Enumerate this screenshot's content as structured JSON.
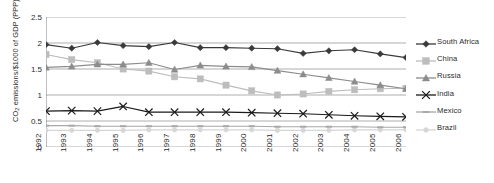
{
  "chart_data": {
    "type": "line",
    "title": "",
    "xlabel": "",
    "ylabel": "CO2 emissions/$1000 of GDP (PPP)",
    "ylabel_prefix": "CO",
    "ylabel_sub": "2",
    "ylabel_suffix": " emissions/$1000 of GDP (PPP)",
    "categories": [
      "1992",
      "1993",
      "1994",
      "1995",
      "1996",
      "1997",
      "1998",
      "1999",
      "2000",
      "2001",
      "2002",
      "2003",
      "2004",
      "2005",
      "2006"
    ],
    "yticks": [
      "0",
      "0.5",
      "1",
      "1.5",
      "2",
      "2.5"
    ],
    "ytick_values": [
      0,
      0.5,
      1,
      1.5,
      2,
      2.5
    ],
    "ylim": [
      0,
      2.5
    ],
    "grid": true,
    "legend_position": "right",
    "series": [
      {
        "name": "South Africa",
        "color": "#3a3a3a",
        "marker": "diamond",
        "values": [
          1.97,
          1.9,
          2.01,
          1.95,
          1.93,
          2.01,
          1.91,
          1.91,
          1.9,
          1.89,
          1.8,
          1.85,
          1.87,
          1.79,
          1.72
        ]
      },
      {
        "name": "China",
        "color": "#bdbdbd",
        "marker": "square",
        "values": [
          1.78,
          1.68,
          1.62,
          1.5,
          1.46,
          1.35,
          1.31,
          1.19,
          1.08,
          1.0,
          1.02,
          1.07,
          1.1,
          1.12,
          1.13
        ]
      },
      {
        "name": "Russia",
        "color": "#8c8c8c",
        "marker": "triangle",
        "values": [
          1.53,
          1.55,
          1.59,
          1.59,
          1.62,
          1.49,
          1.57,
          1.55,
          1.54,
          1.47,
          1.4,
          1.33,
          1.26,
          1.19,
          1.12
        ]
      },
      {
        "name": "India",
        "color": "#1a1a1a",
        "marker": "cross",
        "values": [
          0.69,
          0.7,
          0.69,
          0.78,
          0.67,
          0.67,
          0.67,
          0.67,
          0.66,
          0.65,
          0.64,
          0.62,
          0.6,
          0.59,
          0.58
        ]
      },
      {
        "name": "Mexico",
        "color": "#a8a8a8",
        "marker": "dash",
        "values": [
          0.41,
          0.41,
          0.4,
          0.4,
          0.4,
          0.4,
          0.4,
          0.4,
          0.4,
          0.39,
          0.39,
          0.39,
          0.39,
          0.38,
          0.38
        ]
      },
      {
        "name": "Brazil",
        "color": "#d6d6d6",
        "marker": "dot",
        "values": [
          0.32,
          0.32,
          0.32,
          0.32,
          0.33,
          0.33,
          0.33,
          0.33,
          0.33,
          0.32,
          0.32,
          0.32,
          0.33,
          0.33,
          0.33
        ]
      }
    ]
  }
}
